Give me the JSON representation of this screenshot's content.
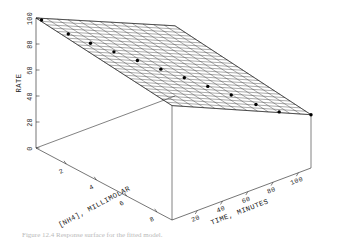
{
  "figure": {
    "caption": "Figure 12.4 Response surface for the fitted model."
  },
  "chart_data": {
    "type": "surface",
    "title": "",
    "zlabel": "RATE",
    "xlabel": "[NH4], MILLIMOLAR",
    "ylabel": "TIME, MINUTES",
    "zlim": [
      0,
      100
    ],
    "z_ticks": [
      "0",
      "20",
      "40",
      "60",
      "80",
      "100"
    ],
    "z_tick_values": [
      0,
      20,
      40,
      60,
      80,
      100
    ],
    "xlim": [
      0,
      9
    ],
    "x_ticks": [
      "2",
      "4",
      "6",
      "8"
    ],
    "x_tick_values": [
      2,
      4,
      6,
      8
    ],
    "ylim": [
      0,
      110
    ],
    "y_ticks": [
      "20",
      "40",
      "60",
      "80",
      "100"
    ],
    "y_tick_values": [
      20,
      40,
      60,
      80,
      100
    ],
    "grid": true,
    "legend": "none",
    "surface_corners": {
      "x0_y0_rate": 100,
      "x9_y0_rate": 88,
      "x0_y110_rate": 54,
      "x9_y110_rate": 41
    },
    "points": [
      {
        "x": 0.2,
        "y": 2,
        "rate": 99
      },
      {
        "x": 1.3,
        "y": 10,
        "rate": 92
      },
      {
        "x": 2.1,
        "y": 18,
        "rate": 87
      },
      {
        "x": 2.9,
        "y": 27,
        "rate": 82
      },
      {
        "x": 3.7,
        "y": 36,
        "rate": 77
      },
      {
        "x": 4.5,
        "y": 45,
        "rate": 72
      },
      {
        "x": 5.3,
        "y": 54,
        "rate": 67
      },
      {
        "x": 6.1,
        "y": 63,
        "rate": 62
      },
      {
        "x": 6.9,
        "y": 72,
        "rate": 57
      },
      {
        "x": 7.7,
        "y": 82,
        "rate": 51
      },
      {
        "x": 8.4,
        "y": 92,
        "rate": 46
      },
      {
        "x": 9.0,
        "y": 110,
        "rate": 41
      }
    ],
    "mesh": {
      "u_divisions": 26,
      "v_divisions": 13,
      "style": "wireframe-hatched"
    }
  }
}
